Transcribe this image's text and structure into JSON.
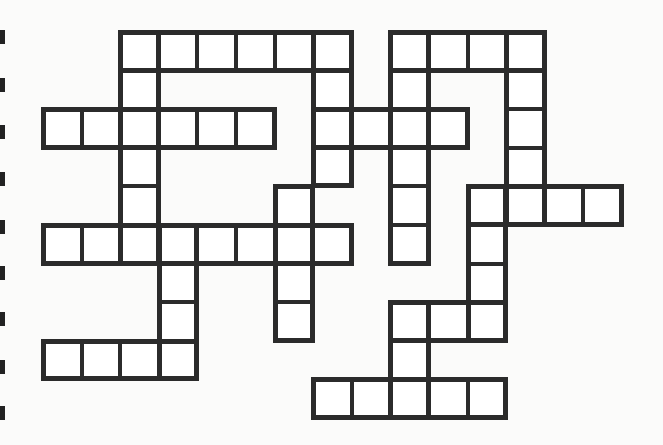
{
  "puzzle": {
    "type": "crossword",
    "cell_size": 38.6,
    "origin_x": 43,
    "origin_y": 32,
    "line_color": "#2b2b2b",
    "cell_color": "#ffffff",
    "words": [
      {
        "id": "row0-a",
        "dir": "across",
        "col": 2,
        "row": 0,
        "len": 6
      },
      {
        "id": "row0-b",
        "dir": "across",
        "col": 9,
        "row": 0,
        "len": 4
      },
      {
        "id": "row2-a",
        "dir": "across",
        "col": 0,
        "row": 2,
        "len": 6
      },
      {
        "id": "row2-b",
        "dir": "across",
        "col": 7,
        "row": 2,
        "len": 4
      },
      {
        "id": "row4-a",
        "dir": "across",
        "col": 11,
        "row": 4,
        "len": 4
      },
      {
        "id": "row5-a",
        "dir": "across",
        "col": 0,
        "row": 5,
        "len": 8
      },
      {
        "id": "row7-a",
        "dir": "across",
        "col": 9,
        "row": 7,
        "len": 3
      },
      {
        "id": "row8-a",
        "dir": "across",
        "col": 0,
        "row": 8,
        "len": 4
      },
      {
        "id": "row9-a",
        "dir": "across",
        "col": 7,
        "row": 9,
        "len": 5
      },
      {
        "id": "col2-d",
        "dir": "down",
        "col": 2,
        "row": 0,
        "len": 6
      },
      {
        "id": "col7-d",
        "dir": "down",
        "col": 7,
        "row": 0,
        "len": 4
      },
      {
        "id": "col9-d",
        "dir": "down",
        "col": 9,
        "row": 0,
        "len": 6
      },
      {
        "id": "col12-d",
        "dir": "down",
        "col": 12,
        "row": 0,
        "len": 5
      },
      {
        "id": "col11-d",
        "dir": "down",
        "col": 11,
        "row": 4,
        "len": 4
      },
      {
        "id": "col6-d",
        "dir": "down",
        "col": 6,
        "row": 4,
        "len": 4
      },
      {
        "id": "col3-d",
        "dir": "down",
        "col": 3,
        "row": 5,
        "len": 4
      },
      {
        "id": "col9-d2",
        "dir": "down",
        "col": 9,
        "row": 7,
        "len": 3
      }
    ],
    "margin_ticks": [
      30,
      78,
      125,
      172,
      220,
      266,
      312,
      360,
      406
    ]
  }
}
